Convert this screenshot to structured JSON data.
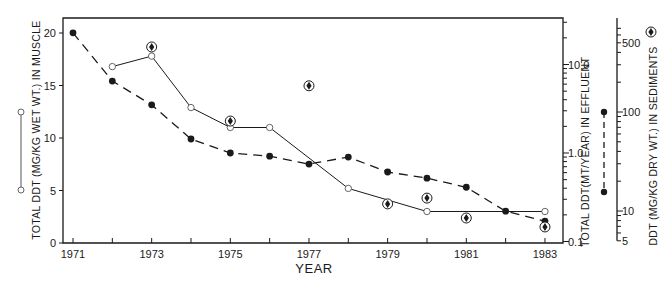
{
  "chart_data": {
    "type": "line",
    "title": "",
    "xlabel": "YEAR",
    "x_ticks": [
      1971,
      1972,
      1973,
      1974,
      1975,
      1976,
      1977,
      1978,
      1979,
      1980,
      1981,
      1982,
      1983
    ],
    "x_tick_labels": [
      "1971",
      "1973",
      "1975",
      "1977",
      "1979",
      "1981",
      "1983"
    ],
    "xlim": [
      1970.8,
      1983.5
    ],
    "grid": false,
    "axes": {
      "left": {
        "label": "TOTAL DDT (MG/KG WET WT.) IN MUSCLE",
        "scale": "linear",
        "ylim": [
          0,
          22
        ],
        "ticks": [
          0,
          5,
          10,
          15,
          20
        ],
        "tick_labels": [
          "0",
          "5",
          "10",
          "15",
          "20"
        ]
      },
      "right_effluent": {
        "label": "TOTAL DDT(MT/YEAR) IN EFFLUENT",
        "scale": "log",
        "ylim": [
          0.1,
          50
        ],
        "labeled_ticks": [
          0.1,
          1.0,
          10.0
        ],
        "tick_labels": [
          "0.1",
          "1.0",
          "10.0"
        ]
      },
      "right_sediments": {
        "label": "DDT (MG/KG DRY WT.) IN SEDIMENTS",
        "scale": "log",
        "ylim": [
          5,
          750
        ],
        "labeled_ticks": [
          5,
          10,
          100,
          500
        ],
        "tick_labels": [
          "5",
          "10",
          "100",
          "500"
        ]
      }
    },
    "series": [
      {
        "name": "Total DDT in muscle",
        "axis": "left",
        "marker": "open-circle",
        "line": "solid",
        "x": [
          1972,
          1973,
          1974,
          1975,
          1976,
          1978,
          1980,
          1983
        ],
        "values": [
          16.8,
          17.8,
          12.9,
          11.0,
          11.0,
          5.2,
          3.0,
          3.0
        ]
      },
      {
        "name": "Total DDT in effluent",
        "axis": "right_effluent",
        "marker": "filled-circle",
        "line": "dashed",
        "x": [
          1971,
          1972,
          1973,
          1974,
          1975,
          1976,
          1977,
          1978,
          1979,
          1980,
          1981,
          1982,
          1983
        ],
        "values": [
          22.8,
          6.5,
          3.5,
          1.44,
          1.0,
          0.92,
          0.75,
          0.9,
          0.61,
          0.52,
          0.41,
          0.22,
          0.17
        ]
      },
      {
        "name": "DDT in sediments",
        "axis": "right_sediments",
        "marker": "circled-dot",
        "line": "none",
        "x": [
          1973,
          1975,
          1977,
          1979,
          1980,
          1981,
          1983
        ],
        "values": [
          454,
          81,
          184,
          11.8,
          13.5,
          8.5,
          6.9
        ]
      }
    ],
    "legend": "symbols drawn beside each axis title"
  }
}
